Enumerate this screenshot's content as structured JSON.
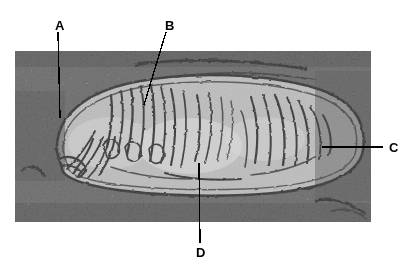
{
  "figure": {
    "kind": "electron-micrograph",
    "caption": "",
    "image_area": {
      "x": 15,
      "y": 51,
      "width": 356,
      "height": 171
    },
    "background_color": "#ffffff",
    "ink_color": "#000000"
  },
  "labels": [
    {
      "id": "A",
      "text": "A",
      "text_x": 55,
      "text_y": 19,
      "leader": {
        "x1": 58,
        "y1": 32,
        "x2": 60,
        "y2": 118
      },
      "points_to": "outer-membrane-left"
    },
    {
      "id": "B",
      "text": "B",
      "text_x": 165,
      "text_y": 19,
      "leader": {
        "x1": 166,
        "y1": 32,
        "x2": 144,
        "y2": 105
      },
      "points_to": "outer-membrane-top"
    },
    {
      "id": "C",
      "text": "C",
      "text_x": 389,
      "text_y": 141,
      "leader": {
        "x1": 383,
        "y1": 147,
        "x2": 322,
        "y2": 147
      },
      "points_to": "crista-right"
    },
    {
      "id": "D",
      "text": "D",
      "text_x": 196,
      "text_y": 246,
      "leader": {
        "x1": 200,
        "y1": 243,
        "x2": 199,
        "y2": 163
      },
      "points_to": "matrix"
    }
  ],
  "colors": {
    "film_light": "#e9e9e9",
    "film_mid": "#b4b4b4",
    "film_dark": "#1a1a1a",
    "matrix": "#d8d8d8",
    "membrane": "#141414",
    "label_ink": "#000000",
    "page": "#ffffff"
  },
  "organelle": {
    "name": "mitochondrion",
    "outline": "M 42 152 C 40 116, 70 92, 120 82 C 175 71, 250 73, 300 88 C 338 99, 352 122, 348 150 C 344 178, 300 192, 230 195 C 150 198, 62 190, 48 172 Z",
    "cristae_count": 26
  }
}
